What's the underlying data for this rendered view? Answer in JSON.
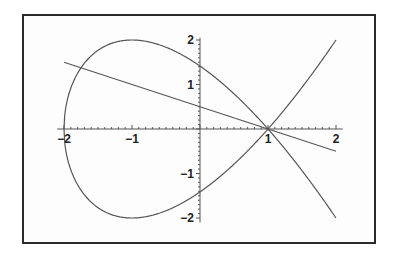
{
  "chart_data": {
    "type": "line",
    "title": "",
    "xlabel": "",
    "ylabel": "",
    "xlim": [
      -2,
      2
    ],
    "ylim": [
      -2,
      2
    ],
    "grid": false,
    "legend": null,
    "x_ticks": [
      -2,
      -1,
      1,
      2
    ],
    "y_ticks": [
      2,
      1,
      -1,
      -2
    ],
    "x_tick_labels": [
      "−2",
      "−1",
      "1",
      "2"
    ],
    "y_tick_labels": [
      "2",
      "1",
      "−1",
      "−2"
    ],
    "series": [
      {
        "name": "nodal cubic y^2 = (x-1)^2 (x+2)",
        "kind": "parametric-curve",
        "equation": "y^2 = (x-1)^2 (x+2)",
        "x_range": [
          -2,
          2
        ],
        "key_points": [
          [
            -2,
            0
          ],
          [
            -1,
            2
          ],
          [
            -1,
            -2
          ],
          [
            0,
            1.414
          ],
          [
            0,
            -1.414
          ],
          [
            1,
            0
          ],
          [
            2,
            2
          ],
          [
            2,
            -2
          ]
        ]
      },
      {
        "name": "line y = -(x-1)/2",
        "kind": "line",
        "slope": -0.5,
        "intercept": 0.5,
        "x_range": [
          -2,
          2
        ],
        "points": [
          [
            -2,
            1.5
          ],
          [
            0,
            0.5
          ],
          [
            1,
            0
          ],
          [
            2,
            -0.5
          ]
        ]
      }
    ],
    "annotations": [
      "curve self-intersects (node) at (1, 0)"
    ]
  },
  "colors": {
    "frame": "#2a2a2a",
    "curve": "#555555",
    "background": "#ffffff"
  }
}
